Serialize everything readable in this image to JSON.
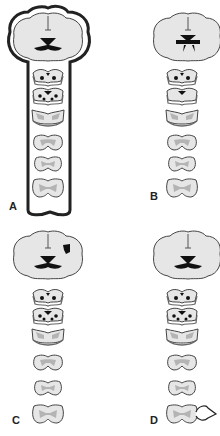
{
  "figure": {
    "panels": [
      {
        "id": "A",
        "label": "A",
        "description": "Brain and full spinal cord enclosed by outline",
        "lesion": "whole-neuraxis-outline",
        "sections": 6
      },
      {
        "id": "B",
        "label": "B",
        "description": "Brain with expanded central gray; spinal cord sections",
        "lesion": "central-brain",
        "sections": 6
      },
      {
        "id": "C",
        "label": "C",
        "description": "Brain with focal cortical lesion on right",
        "lesion": "focal-cortical-right",
        "sections": 6
      },
      {
        "id": "D",
        "label": "D",
        "description": "Brain and spinal cord with lesion at lowest cord section (arrow)",
        "lesion": "distal-cord-arrow",
        "sections": 6
      }
    ],
    "colors": {
      "tissue_fill": "#e6e6e6",
      "gray_matter": "#b4b4b4",
      "outline": "#444444",
      "dark_region": "#111111",
      "label": "#222222"
    }
  }
}
